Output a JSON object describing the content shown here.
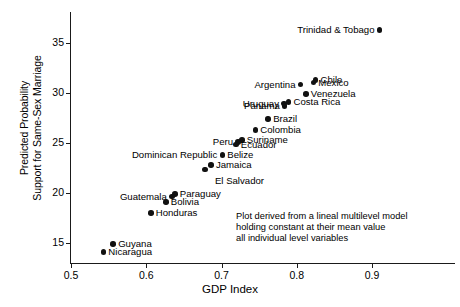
{
  "chart_data": {
    "type": "scatter",
    "title": "",
    "xlabel": "GDP Index",
    "ylabel_line1": "Predicted Probability",
    "ylabel_line2": "Support for Same-Sex Marriage",
    "xlim": [
      0.47,
      0.98
    ],
    "ylim": [
      13.0,
      37.5
    ],
    "xticks": [
      "0.5",
      "0.6",
      "0.7",
      "0.8",
      "0.9"
    ],
    "xtick_values": [
      0.5,
      0.6,
      0.7,
      0.8,
      0.9
    ],
    "yticks": [
      "15",
      "20",
      "25",
      "30",
      "35"
    ],
    "ytick_values": [
      15,
      20,
      25,
      30,
      35
    ],
    "grid": false,
    "legend": "none",
    "annotation_lines": [
      "Plot derived from a lineal multilevel model",
      "holding constant at their mean value",
      "all individual level variables"
    ],
    "marker_color": "#111111",
    "axis_color": "#1a1a1a",
    "points": [
      {
        "label": "Trinidad & Tobago",
        "x": 0.91,
        "y": 36.3,
        "label_side": "left"
      },
      {
        "label": "Chile",
        "x": 0.825,
        "y": 31.3,
        "label_side": "right"
      },
      {
        "label": "Mexico",
        "x": 0.822,
        "y": 31.05,
        "label_side": "right"
      },
      {
        "label": "Argentina",
        "x": 0.805,
        "y": 30.85,
        "label_side": "left"
      },
      {
        "label": "Venezuela",
        "x": 0.812,
        "y": 29.9,
        "label_side": "right"
      },
      {
        "label": "Costa Rica",
        "x": 0.789,
        "y": 29.1,
        "label_side": "right"
      },
      {
        "label": "Uruguay",
        "x": 0.783,
        "y": 28.95,
        "label_side": "left"
      },
      {
        "label": "Panama",
        "x": 0.784,
        "y": 28.7,
        "label_side": "left"
      },
      {
        "label": "Brazil",
        "x": 0.762,
        "y": 27.4,
        "label_side": "right"
      },
      {
        "label": "Colombia",
        "x": 0.745,
        "y": 26.3,
        "label_side": "right"
      },
      {
        "label": "Suriname",
        "x": 0.727,
        "y": 25.3,
        "label_side": "right"
      },
      {
        "label": "Peru",
        "x": 0.722,
        "y": 25.1,
        "label_side": "left"
      },
      {
        "label": "Ecuador",
        "x": 0.719,
        "y": 24.85,
        "label_side": "right"
      },
      {
        "label": "Belize",
        "x": 0.701,
        "y": 23.8,
        "label_side": "right"
      },
      {
        "label": "Dominican Republic",
        "x": 0.701,
        "y": 23.8,
        "label_side": "left"
      },
      {
        "label": "Jamaica",
        "x": 0.686,
        "y": 22.8,
        "label_side": "right"
      },
      {
        "label": "El Salvador",
        "x": 0.678,
        "y": 22.35,
        "label_side": "below"
      },
      {
        "label": "Paraguay",
        "x": 0.638,
        "y": 19.9,
        "label_side": "right"
      },
      {
        "label": "Guatemala",
        "x": 0.634,
        "y": 19.65,
        "label_side": "left"
      },
      {
        "label": "Bolivia",
        "x": 0.626,
        "y": 19.1,
        "label_side": "right"
      },
      {
        "label": "Honduras",
        "x": 0.606,
        "y": 18.0,
        "label_side": "right"
      },
      {
        "label": "Guyana",
        "x": 0.556,
        "y": 14.9,
        "label_side": "right"
      },
      {
        "label": "Nicaragua",
        "x": 0.543,
        "y": 14.1,
        "label_side": "right"
      }
    ]
  }
}
